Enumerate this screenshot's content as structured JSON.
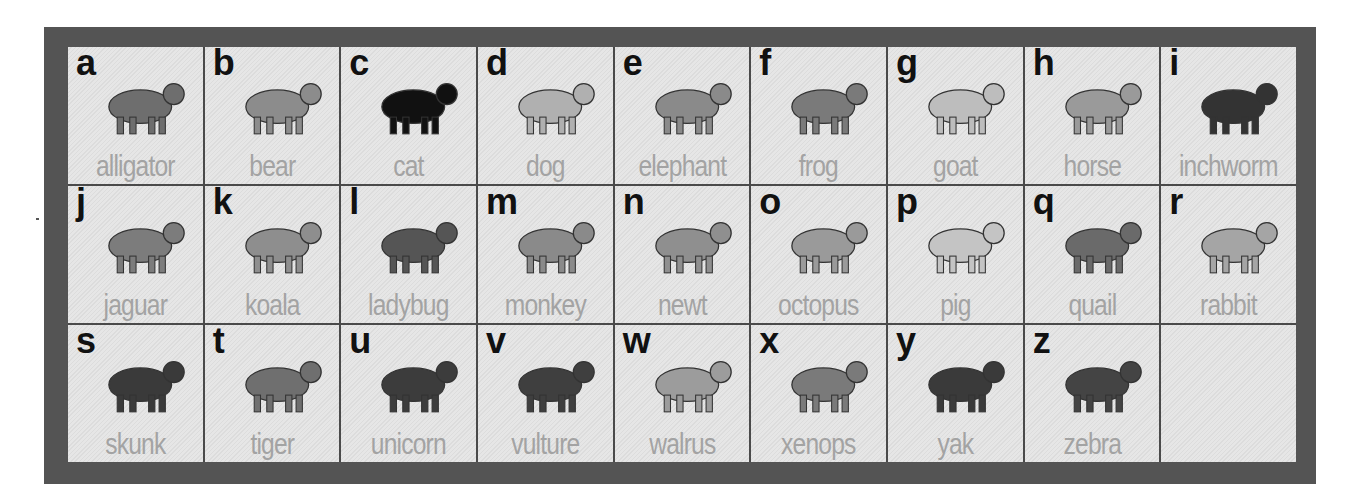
{
  "chart_title": "",
  "colors": {
    "frame": "#545454",
    "cell_background": "#e2e2e2",
    "letter": "#111111",
    "label": "#a3a3a3"
  },
  "cells": [
    {
      "letter": "a",
      "label": "alligator",
      "icon": "alligator-icon",
      "tone": "#6e6e6e"
    },
    {
      "letter": "b",
      "label": "bear",
      "icon": "bear-icon",
      "tone": "#8c8c8c"
    },
    {
      "letter": "c",
      "label": "cat",
      "icon": "cat-icon",
      "tone": "#111111"
    },
    {
      "letter": "d",
      "label": "dog",
      "icon": "dog-icon",
      "tone": "#b0b0b0"
    },
    {
      "letter": "e",
      "label": "elephant",
      "icon": "elephant-icon",
      "tone": "#8a8a8a"
    },
    {
      "letter": "f",
      "label": "frog",
      "icon": "frog-icon",
      "tone": "#7a7a7a"
    },
    {
      "letter": "g",
      "label": "goat",
      "icon": "goat-icon",
      "tone": "#bdbdbd"
    },
    {
      "letter": "h",
      "label": "horse",
      "icon": "horse-icon",
      "tone": "#9a9a9a"
    },
    {
      "letter": "i",
      "label": "inchworm",
      "icon": "inchworm-icon",
      "tone": "#333333"
    },
    {
      "letter": "j",
      "label": "jaguar",
      "icon": "jaguar-icon",
      "tone": "#7c7c7c"
    },
    {
      "letter": "k",
      "label": "koala",
      "icon": "koala-icon",
      "tone": "#8e8e8e"
    },
    {
      "letter": "l",
      "label": "ladybug",
      "icon": "ladybug-icon",
      "tone": "#555555"
    },
    {
      "letter": "m",
      "label": "monkey",
      "icon": "monkey-icon",
      "tone": "#8a8a8a"
    },
    {
      "letter": "n",
      "label": "newt",
      "icon": "newt-icon",
      "tone": "#8f8f8f"
    },
    {
      "letter": "o",
      "label": "octopus",
      "icon": "octopus-icon",
      "tone": "#9a9a9a"
    },
    {
      "letter": "p",
      "label": "pig",
      "icon": "pig-icon",
      "tone": "#c4c4c4"
    },
    {
      "letter": "q",
      "label": "quail",
      "icon": "quail-icon",
      "tone": "#6a6a6a"
    },
    {
      "letter": "r",
      "label": "rabbit",
      "icon": "rabbit-icon",
      "tone": "#a5a5a5"
    },
    {
      "letter": "s",
      "label": "skunk",
      "icon": "skunk-icon",
      "tone": "#3a3a3a"
    },
    {
      "letter": "t",
      "label": "tiger",
      "icon": "tiger-icon",
      "tone": "#6f6f6f"
    },
    {
      "letter": "u",
      "label": "unicorn",
      "icon": "unicorn-icon",
      "tone": "#3c3c3c"
    },
    {
      "letter": "v",
      "label": "vulture",
      "icon": "vulture-icon",
      "tone": "#3f3f3f"
    },
    {
      "letter": "w",
      "label": "walrus",
      "icon": "walrus-icon",
      "tone": "#9c9c9c"
    },
    {
      "letter": "x",
      "label": "xenops",
      "icon": "xenops-icon",
      "tone": "#7a7a7a"
    },
    {
      "letter": "y",
      "label": "yak",
      "icon": "yak-icon",
      "tone": "#3a3a3a"
    },
    {
      "letter": "z",
      "label": "zebra",
      "icon": "zebra-icon",
      "tone": "#444444"
    },
    {
      "letter": "",
      "label": "",
      "icon": "",
      "tone": ""
    }
  ]
}
